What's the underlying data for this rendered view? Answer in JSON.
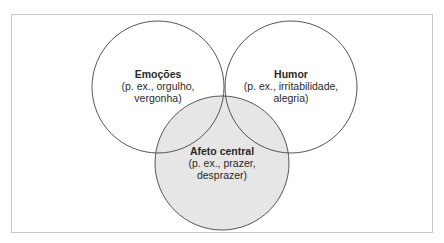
{
  "colors": {
    "frame_border": "#c9c9c9",
    "circle_stroke": "#555555",
    "core_fill": "#e6e6e6",
    "text": "#2a2a2a"
  },
  "circles": [
    {
      "id": "emocoes",
      "title": "Emoções",
      "lines": [
        "(p. ex., orgulho,",
        "vergonha)"
      ],
      "cx": 158,
      "cy": 87,
      "r": 66,
      "filled": false
    },
    {
      "id": "humor",
      "title": "Humor",
      "lines": [
        "(p. ex., irritabilidade,",
        "alegria)"
      ],
      "cx": 291,
      "cy": 87,
      "r": 66,
      "filled": false
    },
    {
      "id": "afeto-central",
      "title": "Afeto central",
      "lines": [
        "(p. ex., prazer,",
        "desprazer)"
      ],
      "cx": 222,
      "cy": 163,
      "r": 67,
      "filled": true
    }
  ]
}
